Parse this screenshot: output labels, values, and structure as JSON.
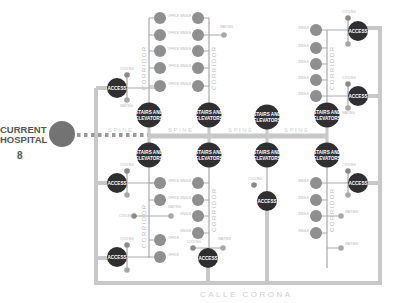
{
  "current_hospital": {
    "label_line1": "CURRENT",
    "label_line2": "HOSPITAL",
    "number": "8"
  },
  "labels": {
    "stairs_line1": "STAIRS AND",
    "stairs_line2": "ELEVATORS",
    "access": "ACCESS",
    "corridor": "CORRIDOR",
    "spine": "SPINE",
    "street": "CALLE CORONA",
    "office_room_1": "OFFICE",
    "office_room_2": "ROOM",
    "single_room_1": "SINGLE",
    "single_room_2": "ROOM",
    "cooling": "COOLING",
    "waiting_room_1": "WAITING",
    "waiting_room_2": "ROOM"
  },
  "colors": {
    "dark_node": "#2f2f2f",
    "room_node": "#8f8f8f",
    "rail": "#c8c8c8",
    "text_gray": "#b5b5b5"
  }
}
